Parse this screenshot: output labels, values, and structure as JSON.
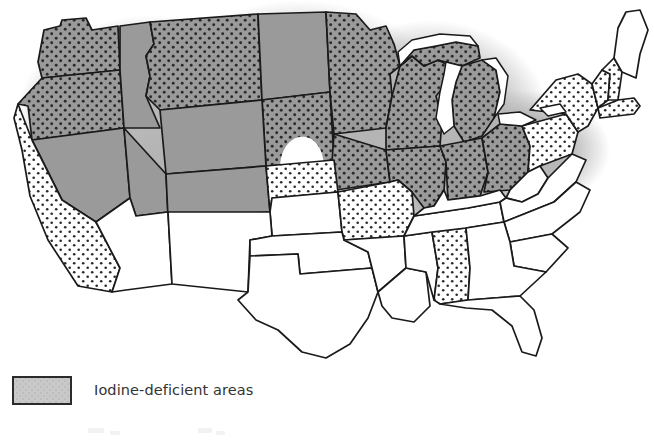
{
  "figure": {
    "kind": "thematic-map",
    "region": "United States (contiguous 48 states)",
    "background_color": "#ffffff",
    "outline_color": "#1a1a1a"
  },
  "legend": {
    "label": "Iodine-deficient areas",
    "swatch_fill": "#c9c9c9",
    "swatch_border": "#2b2b2b",
    "entries": [
      {
        "label": "Iodine-deficient areas",
        "fill": "#c9c9c9"
      }
    ]
  },
  "map_data": {
    "type": "choropleth",
    "classes": [
      {
        "key": "heavy",
        "label": "Iodine-deficient areas",
        "fill": "#8f8f8f",
        "pattern": "dark-dots"
      },
      {
        "key": "solid",
        "label": "Iodine-deficient areas",
        "fill": "#9a9a9a",
        "pattern": "none"
      },
      {
        "key": "light",
        "label": "Iodine-deficient areas",
        "fill": "#ffffff",
        "pattern": "light-dots"
      },
      {
        "key": "none",
        "label": "Not shaded",
        "fill": "#ffffff",
        "pattern": "none"
      }
    ],
    "states": [
      {
        "name": "Washington",
        "abbr": "WA",
        "class": "heavy"
      },
      {
        "name": "Oregon",
        "abbr": "OR",
        "class": "heavy"
      },
      {
        "name": "Idaho",
        "abbr": "ID",
        "class": "solid"
      },
      {
        "name": "Montana",
        "abbr": "MT",
        "class": "heavy"
      },
      {
        "name": "North Dakota",
        "abbr": "ND",
        "class": "solid"
      },
      {
        "name": "South Dakota",
        "abbr": "SD",
        "class": "heavy"
      },
      {
        "name": "Minnesota",
        "abbr": "MN",
        "class": "heavy"
      },
      {
        "name": "Wisconsin",
        "abbr": "WI",
        "class": "heavy"
      },
      {
        "name": "Michigan",
        "abbr": "MI",
        "class": "heavy"
      },
      {
        "name": "Iowa",
        "abbr": "IA",
        "class": "heavy"
      },
      {
        "name": "Illinois",
        "abbr": "IL",
        "class": "heavy"
      },
      {
        "name": "Indiana",
        "abbr": "IN",
        "class": "heavy"
      },
      {
        "name": "Ohio",
        "abbr": "OH",
        "class": "heavy"
      },
      {
        "name": "Pennsylvania",
        "abbr": "PA",
        "class": "light"
      },
      {
        "name": "New York",
        "abbr": "NY",
        "class": "light"
      },
      {
        "name": "Vermont",
        "abbr": "VT",
        "class": "light"
      },
      {
        "name": "New Hampshire",
        "abbr": "NH",
        "class": "light"
      },
      {
        "name": "Massachusetts",
        "abbr": "MA",
        "class": "light"
      },
      {
        "name": "Maine",
        "abbr": "ME",
        "class": "none"
      },
      {
        "name": "Wyoming",
        "abbr": "WY",
        "class": "solid"
      },
      {
        "name": "Nevada",
        "abbr": "NV",
        "class": "solid"
      },
      {
        "name": "Utah",
        "abbr": "UT",
        "class": "solid"
      },
      {
        "name": "Colorado",
        "abbr": "CO",
        "class": "solid"
      },
      {
        "name": "California",
        "abbr": "CA",
        "class": "light"
      },
      {
        "name": "Nebraska",
        "abbr": "NE",
        "class": "light"
      },
      {
        "name": "Kansas",
        "abbr": "KS",
        "class": "none"
      },
      {
        "name": "Missouri",
        "abbr": "MO",
        "class": "light"
      },
      {
        "name": "Arizona",
        "abbr": "AZ",
        "class": "none"
      },
      {
        "name": "New Mexico",
        "abbr": "NM",
        "class": "none"
      },
      {
        "name": "Oklahoma",
        "abbr": "OK",
        "class": "none"
      },
      {
        "name": "Texas",
        "abbr": "TX",
        "class": "none"
      },
      {
        "name": "Arkansas",
        "abbr": "AR",
        "class": "none"
      },
      {
        "name": "Louisiana",
        "abbr": "LA",
        "class": "none"
      },
      {
        "name": "Mississippi",
        "abbr": "MS",
        "class": "none"
      },
      {
        "name": "Alabama",
        "abbr": "AL",
        "class": "light"
      },
      {
        "name": "Tennessee",
        "abbr": "TN",
        "class": "none"
      },
      {
        "name": "Kentucky",
        "abbr": "KY",
        "class": "none"
      },
      {
        "name": "West Virginia",
        "abbr": "WV",
        "class": "none"
      },
      {
        "name": "Virginia",
        "abbr": "VA",
        "class": "none"
      },
      {
        "name": "North Carolina",
        "abbr": "NC",
        "class": "none"
      },
      {
        "name": "South Carolina",
        "abbr": "SC",
        "class": "none"
      },
      {
        "name": "Georgia",
        "abbr": "GA",
        "class": "none"
      },
      {
        "name": "Florida",
        "abbr": "FL",
        "class": "none"
      }
    ],
    "water_features": [
      {
        "name": "Lake Superior"
      },
      {
        "name": "Lake Michigan"
      },
      {
        "name": "Lake Huron"
      },
      {
        "name": "Lake Erie"
      },
      {
        "name": "Lake Ontario"
      }
    ]
  }
}
